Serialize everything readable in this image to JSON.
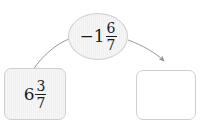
{
  "exercise": {
    "type": "drag-and-drop-math",
    "nodes": {
      "operation_bubble": {
        "shape": "ellipse",
        "sign": "−",
        "whole": "1",
        "numerator": "6",
        "denominator": "7",
        "full_text": "−1 6/7"
      },
      "source_tile": {
        "shape": "rounded-rect",
        "whole": "6",
        "numerator": "3",
        "denominator": "7",
        "full_text": "6 3/7"
      },
      "target_tile": {
        "shape": "rounded-rect",
        "value": "",
        "state": "empty"
      }
    },
    "connectors": [
      {
        "name": "left-curve",
        "from": "source_tile",
        "to": "operation_bubble",
        "arrowhead": false
      },
      {
        "name": "right-arrow",
        "from": "operation_bubble",
        "to": "target_tile",
        "arrowhead": true
      }
    ],
    "colors": {
      "tile_fill": "#f6f6f6",
      "tile_border": "#cfcfcf",
      "empty_fill": "#ffffff",
      "connector": "#9a9a9a",
      "text": "#1b1b1b"
    }
  }
}
